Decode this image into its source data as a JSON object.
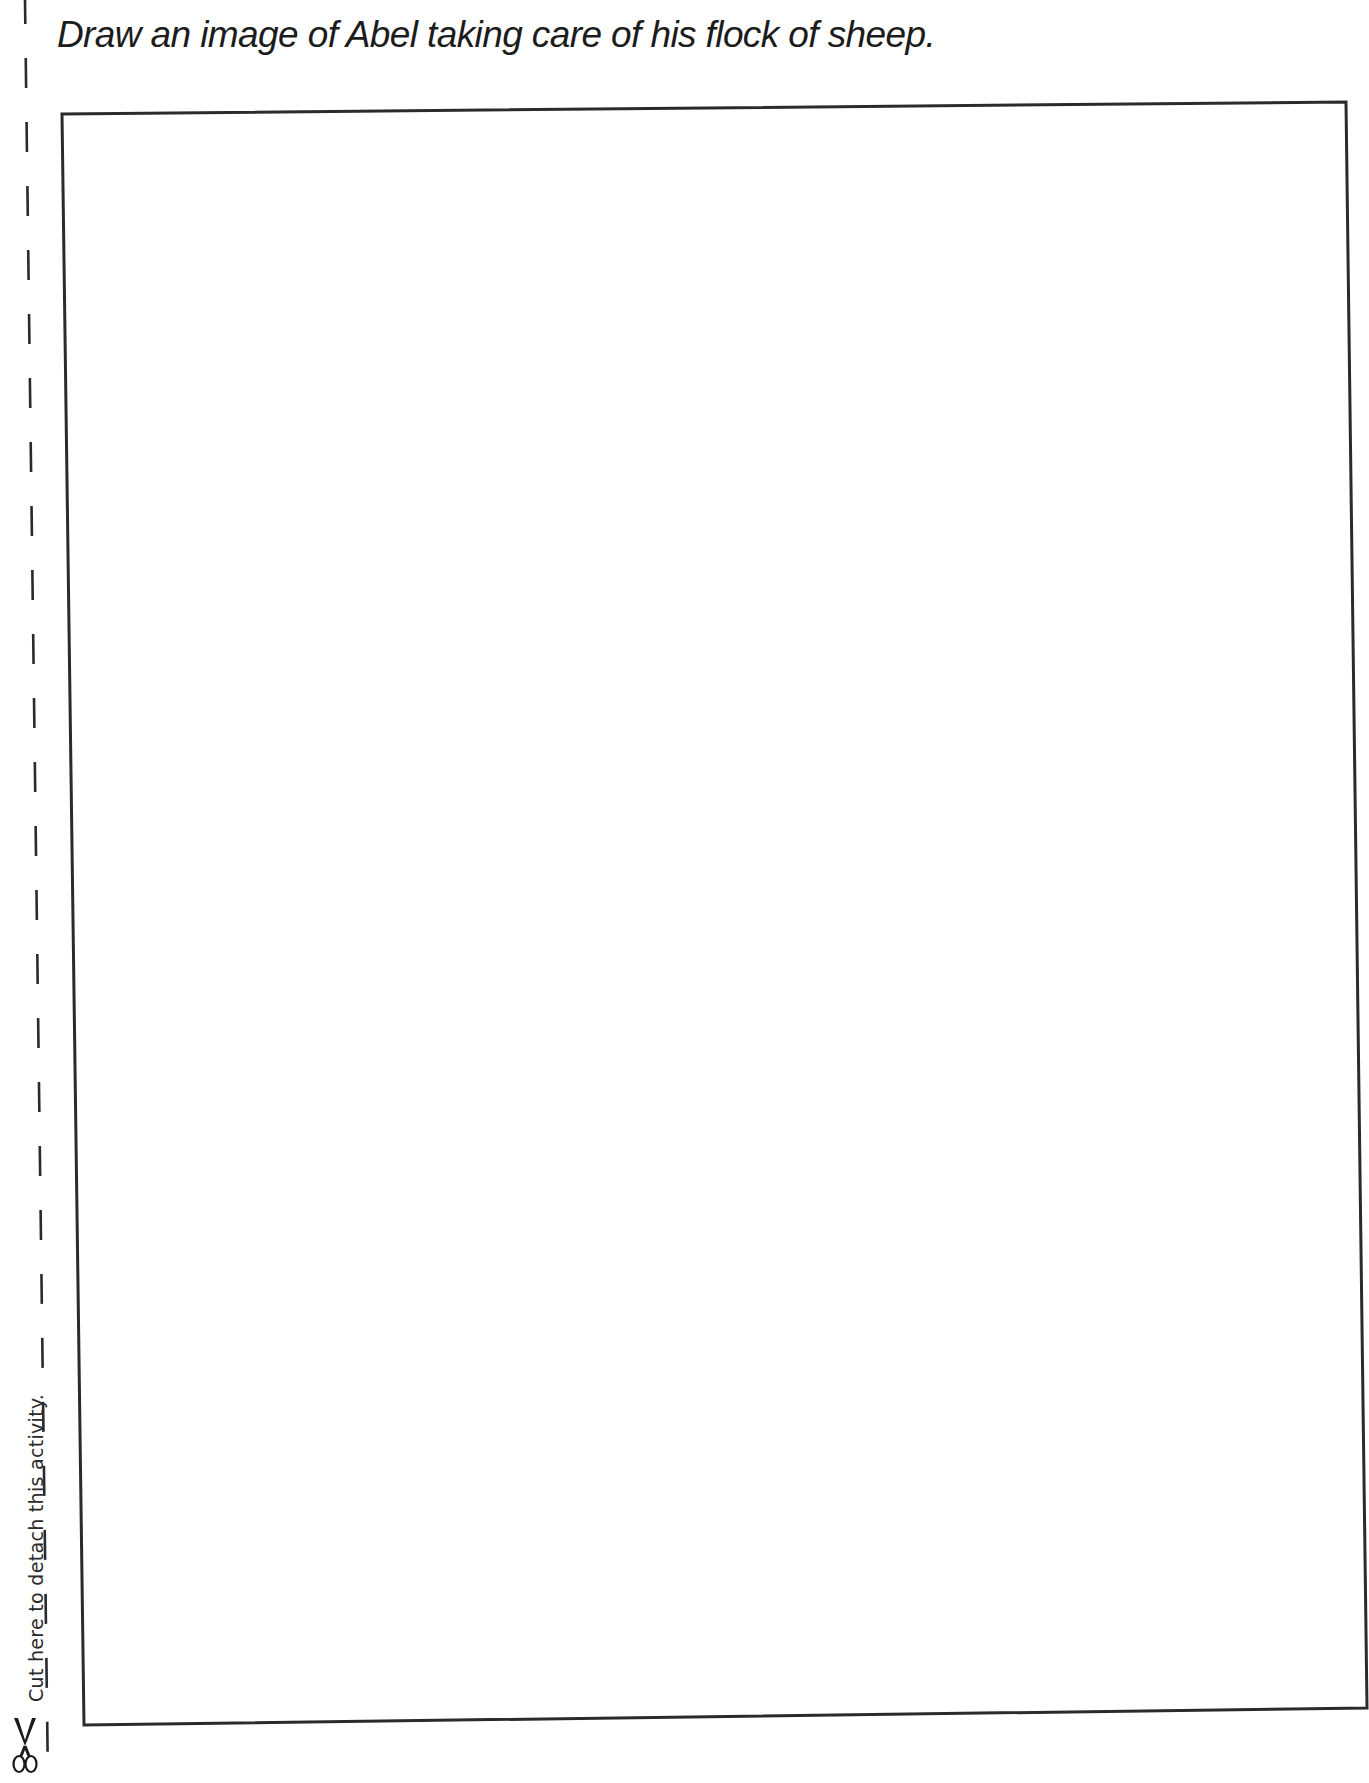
{
  "page": {
    "instruction": "Draw an image of Abel taking care of his flock of sheep.",
    "cut_line_label": "Cut here to detach this activity.",
    "icons": {
      "scissors": "scissors-icon"
    },
    "colors": {
      "ink": "#1c1c1c",
      "frame": "#2b2b2b",
      "paper": "#ffffff"
    }
  }
}
